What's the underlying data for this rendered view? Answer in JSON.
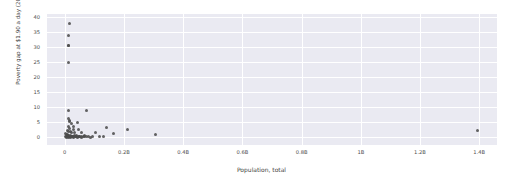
{
  "chart_data": {
    "type": "scatter",
    "title": "",
    "xlabel": "Population, total",
    "ylabel": "Poverty gap at $1.90 a day (2011 PPP) (%)",
    "xlim": [
      -0.06,
      1.46
    ],
    "ylim": [
      -2.5,
      41
    ],
    "xticks": [
      0,
      0.2,
      0.4,
      0.6,
      0.8,
      1.0,
      1.2,
      1.4
    ],
    "xticklabels": [
      "0",
      "0.2B",
      "0.4B",
      "0.6B",
      "0.8B",
      "1B",
      "1.2B",
      "1.4B"
    ],
    "yticks": [
      0,
      5,
      10,
      15,
      20,
      25,
      30,
      35,
      40
    ],
    "yticklabels": [
      "0",
      "5",
      "10",
      "15",
      "20",
      "25",
      "30",
      "35",
      "40"
    ],
    "grid": true,
    "legend": null,
    "marker_color": "#4c4c4c",
    "plot_background": "#eaeaf2",
    "figure_background": "#ffffff",
    "points": [
      [
        0.016,
        38.0
      ],
      [
        0.013,
        34.0
      ],
      [
        0.012,
        30.6
      ],
      [
        0.011,
        30.4
      ],
      [
        0.013,
        25.0
      ],
      [
        0.013,
        8.9
      ],
      [
        0.075,
        9.1
      ],
      [
        0.013,
        6.4
      ],
      [
        0.015,
        5.8
      ],
      [
        0.016,
        5.2
      ],
      [
        0.022,
        4.6
      ],
      [
        0.043,
        4.9
      ],
      [
        0.031,
        3.8
      ],
      [
        0.013,
        3.5
      ],
      [
        0.016,
        3.0
      ],
      [
        0.028,
        2.6
      ],
      [
        0.046,
        2.5
      ],
      [
        0.14,
        3.3
      ],
      [
        0.01,
        2.3
      ],
      [
        0.014,
        2.1
      ],
      [
        0.02,
        1.9
      ],
      [
        0.024,
        1.8
      ],
      [
        0.033,
        1.7
      ],
      [
        0.055,
        1.6
      ],
      [
        0.103,
        1.5
      ],
      [
        0.165,
        1.2
      ],
      [
        0.213,
        2.8
      ],
      [
        0.305,
        0.9
      ],
      [
        1.395,
        2.3
      ],
      [
        0.004,
        1.3
      ],
      [
        0.006,
        1.1
      ],
      [
        0.008,
        1.0
      ],
      [
        0.009,
        0.8
      ],
      [
        0.011,
        0.7
      ],
      [
        0.012,
        0.55
      ],
      [
        0.014,
        0.45
      ],
      [
        0.016,
        0.4
      ],
      [
        0.018,
        0.35
      ],
      [
        0.021,
        0.5
      ],
      [
        0.024,
        0.3
      ],
      [
        0.026,
        0.45
      ],
      [
        0.029,
        0.25
      ],
      [
        0.032,
        0.6
      ],
      [
        0.035,
        0.3
      ],
      [
        0.038,
        0.2
      ],
      [
        0.041,
        0.5
      ],
      [
        0.046,
        0.35
      ],
      [
        0.05,
        0.25
      ],
      [
        0.056,
        0.4
      ],
      [
        0.062,
        0.3
      ],
      [
        0.068,
        0.55
      ],
      [
        0.074,
        0.25
      ],
      [
        0.081,
        0.45
      ],
      [
        0.003,
        0.2
      ],
      [
        0.005,
        0.35
      ],
      [
        0.007,
        0.15
      ],
      [
        0.01,
        0.25
      ],
      [
        0.013,
        0.1
      ],
      [
        0.017,
        0.2
      ],
      [
        0.02,
        0.12
      ],
      [
        0.023,
        0.3
      ],
      [
        0.027,
        0.18
      ],
      [
        0.031,
        0.08
      ],
      [
        0.036,
        0.22
      ],
      [
        0.043,
        0.14
      ],
      [
        0.049,
        0.28
      ],
      [
        0.058,
        0.1
      ],
      [
        0.065,
        0.2
      ],
      [
        0.118,
        0.3
      ],
      [
        0.13,
        0.25
      ],
      [
        0.086,
        0.15
      ],
      [
        0.092,
        0.35
      ]
    ]
  }
}
